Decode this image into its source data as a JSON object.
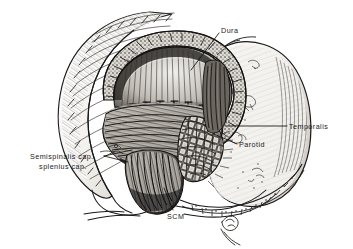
{
  "figure": {
    "background_color": "#ffffff",
    "ink_color": "#1a1a1a",
    "leader_color": "#111111",
    "shade_light": "#e8e6e2",
    "shade_mid": "#b9b5ae",
    "shade_dark": "#6f6b65",
    "shade_darkest": "#2a2724"
  },
  "labels": [
    {
      "id": "dura",
      "name": "label-dura",
      "text": "Dura",
      "lines": [
        "Dura"
      ],
      "x": 221,
      "y": 26,
      "align": "left",
      "leader": {
        "from_x": 219,
        "from_y": 33,
        "to_x": 191,
        "to_y": 70
      }
    },
    {
      "id": "temporalis",
      "name": "label-temporalis",
      "text": "Temporalis",
      "lines": [
        "Temporalis"
      ],
      "x": 289,
      "y": 122,
      "align": "left",
      "leader": {
        "from_x": 287,
        "from_y": 126,
        "to_x": 225,
        "to_y": 126
      }
    },
    {
      "id": "parotid",
      "name": "label-parotid",
      "text": "Parotid",
      "lines": [
        "Parotid"
      ],
      "x": 239,
      "y": 140,
      "align": "left",
      "leader": {
        "from_x": 237,
        "from_y": 144,
        "to_x": 214,
        "to_y": 134
      }
    },
    {
      "id": "semispinalis",
      "name": "label-semispinalis-splenius",
      "text": "Semispinalis cap., splenius cap.",
      "lines": [
        "Semispinalis cap.,",
        "splenius cap."
      ],
      "x": 21,
      "y": 152,
      "align": "left",
      "leader": {
        "from_x": 104,
        "from_y": 156,
        "to_x": 130,
        "to_y": 152
      }
    },
    {
      "id": "scm",
      "name": "label-scm",
      "text": "SCM",
      "lines": [
        "SCM"
      ],
      "x": 167,
      "y": 212,
      "align": "left",
      "leader": {
        "from_x": 173,
        "from_y": 211,
        "to_x": 164,
        "to_y": 188
      }
    }
  ],
  "anatomy": [
    {
      "id": "scalp-flap-posterior",
      "name": "scalp-flap-posterior",
      "label": "Reflected hair-bearing scalp flap (posterior)"
    },
    {
      "id": "scalp-flap-anterior",
      "name": "scalp-flap-anterior",
      "label": "Reflected scalp flap (anterior / auricular)"
    },
    {
      "id": "bone-edge",
      "name": "craniotomy-bone-edge",
      "label": "Craniotomy bone edge"
    },
    {
      "id": "dura",
      "name": "dura-mater",
      "label": "Dura mater"
    },
    {
      "id": "suture-line",
      "name": "dural-suture-line",
      "label": "Dural suture / tack-up stitch line"
    },
    {
      "id": "nuchal-muscle",
      "name": "nuchal-muscle-mass",
      "label": "Semispinalis capitis and splenius capitis"
    },
    {
      "id": "scm",
      "name": "sternocleidomastoid",
      "label": "Sternocleidomastoid muscle"
    },
    {
      "id": "parotid",
      "name": "parotid-gland",
      "label": "Parotid gland"
    },
    {
      "id": "temporalis",
      "name": "temporalis-muscle",
      "label": "Temporalis muscle"
    },
    {
      "id": "neck-contour",
      "name": "neck-contour",
      "label": "Neck and shoulder contour"
    },
    {
      "id": "ear-detail",
      "name": "auricle-detail",
      "label": "Auricular detail sketch"
    }
  ]
}
